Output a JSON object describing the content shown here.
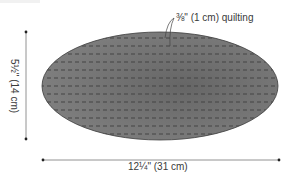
{
  "diagram": {
    "type": "sewing-pattern-shape",
    "shape": "oval",
    "callout": {
      "label": "⅜\" (1 cm) quilting"
    },
    "dimensions": {
      "width": {
        "label": "12¼\" (31 cm)",
        "value_in": "12 1/4",
        "value_cm": 31
      },
      "height": {
        "label": "5½\" (14 cm)",
        "value_in": "5 1/2",
        "value_cm": 14
      }
    },
    "colors": {
      "fill": "#7a7a7a",
      "fill_dark": "#6a6a6a",
      "outline": "#3c3c3c",
      "stitch": "#4a4a4a",
      "dimension_line": "#555555",
      "text": "#3a3a3a"
    },
    "stitch_rows": 13
  }
}
